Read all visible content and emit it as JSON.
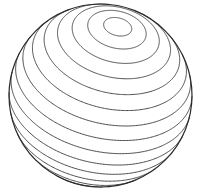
{
  "illustration": {
    "subject": "sphere with contour rings",
    "background": "#ffffff",
    "stroke_color": "#3a3a3a",
    "outline_color": "#2a2a2a",
    "sphere": {
      "cx": 100.5,
      "cy": 95.5,
      "r": 91.5
    },
    "pole": {
      "x": 0.19,
      "y": -0.76,
      "z": 0.62
    },
    "ring_angles_deg": [
      9,
      19,
      29,
      39,
      49,
      59,
      69,
      79,
      89,
      99,
      109,
      119,
      129,
      139,
      149,
      159
    ]
  }
}
